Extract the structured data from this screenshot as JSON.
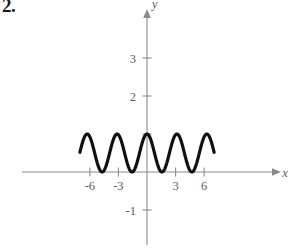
{
  "problem": {
    "number": "2."
  },
  "chart_data": {
    "type": "line",
    "title": "",
    "subtitle": "",
    "xlabel": "x",
    "ylabel": "y",
    "xlim": [
      -7.6,
      7.6
    ],
    "ylim": [
      -1.6,
      3.6
    ],
    "grid": false,
    "legend": "none",
    "x_ticks": [
      -6,
      -3,
      3,
      6
    ],
    "x_tick_labels": [
      "-6",
      "-3",
      "3",
      "6"
    ],
    "y_ticks": [
      3,
      2,
      1,
      -1
    ],
    "y_tick_labels": [
      "3",
      "2",
      "",
      "-1"
    ],
    "series": [
      {
        "name": "y = cos^2(x)",
        "amplitude": 0.5,
        "offset": 0.5,
        "period": 3.14159,
        "phase": 0,
        "x_start": -7.05,
        "x_end": 7.05,
        "color": "#111111",
        "peaks_x": [
          -6.283,
          -3.142,
          0,
          3.142,
          6.283
        ],
        "peaks_y": [
          1,
          1,
          1,
          1,
          1
        ],
        "minima_x": [
          -7.069,
          -4.712,
          -1.571,
          1.571,
          4.712,
          7.069
        ],
        "minima_y": [
          0,
          0,
          0,
          0,
          0,
          0
        ],
        "visible_peak_count": 8
      }
    ],
    "axis_color": "#8a8a8a",
    "curve_color": "#111111"
  },
  "icons": {
    "x_axis_arrow": "arrow-right-icon",
    "y_axis_arrow": "arrow-up-icon"
  }
}
